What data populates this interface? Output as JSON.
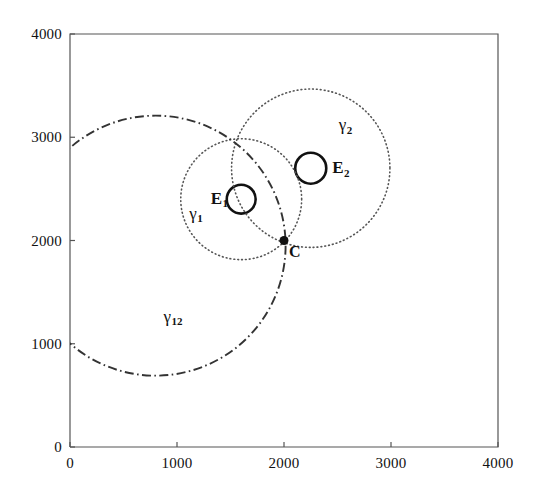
{
  "figure": {
    "background_color": "#ffffff",
    "ink_color": "#111111",
    "axis_color": "#555555"
  },
  "chart_data": {
    "type": "scatter",
    "title": "",
    "xlabel": "",
    "ylabel": "",
    "xlim": [
      0,
      4000
    ],
    "ylim": [
      0,
      4000
    ],
    "grid": false,
    "legend_position": "none",
    "x_ticks": [
      0,
      1000,
      2000,
      3000,
      4000
    ],
    "y_ticks": [
      0,
      1000,
      2000,
      3000,
      4000
    ],
    "x_tick_labels": [
      "0",
      "1000",
      "2000",
      "3000",
      "4000"
    ],
    "y_tick_labels": [
      "0",
      "1000",
      "2000",
      "3000",
      "4000"
    ],
    "points": [
      {
        "name": "C",
        "label": "C",
        "x": 2000,
        "y": 2000,
        "marker": "filled-circle",
        "marker_size_px": 9,
        "color": "#111111",
        "label_dx_px": 5,
        "label_dy_px": 11
      }
    ],
    "circles": [
      {
        "name": "E1",
        "label": "E",
        "sublabel": "1",
        "cx": 1600,
        "cy": 2400,
        "r": 135,
        "style": "solid",
        "linewidth": 2.6,
        "color": "#111111",
        "label_dx_px": -30,
        "label_dy_px": -9
      },
      {
        "name": "E2",
        "label": "E",
        "sublabel": "2",
        "cx": 2250,
        "cy": 2700,
        "r": 145,
        "style": "solid",
        "linewidth": 2.6,
        "color": "#111111",
        "label_dx_px": 20,
        "label_dy_px": -9
      },
      {
        "name": "gamma1",
        "label": "γ",
        "sublabel": "1",
        "cx": 1600,
        "cy": 2400,
        "r": 565,
        "style": "dotted",
        "linewidth": 1.6,
        "color": "#555555",
        "label_dx_px": -52,
        "label_dy_px": 6
      },
      {
        "name": "gamma2",
        "label": "γ",
        "sublabel": "2",
        "cx": 2250,
        "cy": 2700,
        "r": 740,
        "style": "dotted",
        "linewidth": 1.6,
        "color": "#555555",
        "label_dx_px": 28,
        "label_dy_px": -52
      },
      {
        "name": "gamma12",
        "label": "γ",
        "sublabel": "12",
        "cx": 800,
        "cy": 1950,
        "r": 1215,
        "style": "dashdot",
        "linewidth": 1.9,
        "color": "#333333",
        "label_dx_px": 8,
        "label_dy_px": 62
      }
    ],
    "annotations": [
      {
        "text": "γ₁",
        "x": 1050,
        "y": 2360
      },
      {
        "text": "γ₂",
        "x": 2500,
        "y": 3300
      },
      {
        "text": "γ₁₂",
        "x": 1300,
        "y": 1130
      },
      {
        "text": "E₁",
        "x": 1380,
        "y": 2470
      },
      {
        "text": "E₂",
        "x": 2520,
        "y": 2760
      },
      {
        "text": "C",
        "x": 2075,
        "y": 1900
      }
    ]
  },
  "axes_geometry": {
    "left_px": 70,
    "right_px": 498,
    "top_px": 34,
    "bottom_px": 447,
    "tick_len_px": 5
  }
}
